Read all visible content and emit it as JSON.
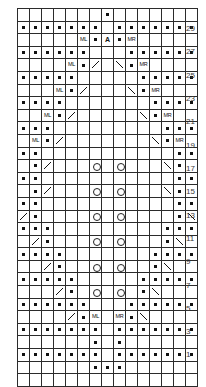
{
  "chart": {
    "columns": 15,
    "rows": 30,
    "cell_width_px": 11,
    "cell_height_px": 11.6,
    "grid_color": "#2b2b2b",
    "background": "#ffffff",
    "symbol_color": "#111111",
    "legend": {
      "dot": "purl",
      "yo": "yarn-over",
      "k2tog": "left-leaning-decrease",
      "ssk": "right-leaning-decrease",
      "cdd": "central-double-decrease",
      "ML": "make-left",
      "MR": "make-right",
      "blank": "knit"
    },
    "row_numbers": [
      {
        "label": "29",
        "top_px": 24
      },
      {
        "label": "27",
        "top_px": 47
      },
      {
        "label": "25",
        "top_px": 71
      },
      {
        "label": "23",
        "top_px": 94
      },
      {
        "label": "21",
        "top_px": 117
      },
      {
        "label": "19",
        "top_px": 141
      },
      {
        "label": "17",
        "top_px": 164
      },
      {
        "label": "15",
        "top_px": 187
      },
      {
        "label": "13",
        "top_px": 211
      },
      {
        "label": "11",
        "top_px": 234
      },
      {
        "label": "9",
        "top_px": 257
      },
      {
        "label": "7",
        "top_px": 281
      },
      {
        "label": "5",
        "top_px": 304
      },
      {
        "label": "3",
        "top_px": 327
      },
      {
        "label": "1",
        "top_px": 350
      }
    ],
    "cells": [
      [
        "",
        "",
        "",
        "",
        "",
        "",
        "",
        "dot",
        "",
        "",
        "",
        "",
        "",
        "",
        ""
      ],
      [
        "dot",
        "dot",
        "dot",
        "dot",
        "dot",
        "dot",
        "dot",
        "",
        "dot",
        "dot",
        "dot",
        "dot",
        "dot",
        "dot",
        "dot"
      ],
      [
        "",
        "",
        "",
        "",
        "",
        "ML",
        "dot",
        "cdd",
        "dot",
        "MR",
        "",
        "",
        "",
        "",
        ""
      ],
      [
        "dot",
        "dot",
        "dot",
        "dot",
        "dot",
        "dot",
        "",
        "",
        "",
        "dot",
        "dot",
        "dot",
        "dot",
        "dot",
        "dot"
      ],
      [
        "",
        "",
        "",
        "",
        "ML",
        "dot",
        "k2tog",
        "",
        "ssk",
        "dot",
        "MR",
        "",
        "",
        "",
        ""
      ],
      [
        "dot",
        "dot",
        "dot",
        "dot",
        "dot",
        "",
        "",
        "",
        "",
        "",
        "dot",
        "dot",
        "dot",
        "dot",
        "dot"
      ],
      [
        "",
        "",
        "",
        "ML",
        "dot",
        "k2tog",
        "",
        "",
        "",
        "ssk",
        "dot",
        "MR",
        "",
        "",
        ""
      ],
      [
        "dot",
        "dot",
        "dot",
        "dot",
        "",
        "",
        "",
        "",
        "",
        "",
        "",
        "dot",
        "dot",
        "dot",
        "dot"
      ],
      [
        "",
        "",
        "ML",
        "dot",
        "k2tog",
        "",
        "",
        "",
        "",
        "",
        "ssk",
        "dot",
        "MR",
        "",
        ""
      ],
      [
        "dot",
        "dot",
        "dot",
        "",
        "",
        "",
        "",
        "",
        "",
        "",
        "",
        "",
        "dot",
        "dot",
        "dot"
      ],
      [
        "",
        "ML",
        "dot",
        "k2tog",
        "",
        "",
        "",
        "",
        "",
        "",
        "",
        "ssk",
        "dot",
        "MR",
        ""
      ],
      [
        "dot",
        "dot",
        "",
        "",
        "",
        "",
        "",
        "",
        "",
        "",
        "",
        "",
        "",
        "dot",
        "dot"
      ],
      [
        "",
        "dot",
        "k2tog",
        "",
        "",
        "",
        "yo",
        "",
        "yo",
        "",
        "",
        "",
        "ssk",
        "dot",
        ""
      ],
      [
        "dot",
        "dot",
        "",
        "",
        "",
        "",
        "",
        "",
        "",
        "",
        "",
        "",
        "",
        "dot",
        "dot"
      ],
      [
        "",
        "dot",
        "k2tog",
        "",
        "",
        "",
        "yo",
        "",
        "yo",
        "",
        "",
        "",
        "ssk",
        "dot",
        ""
      ],
      [
        "dot",
        "dot",
        "",
        "",
        "",
        "",
        "",
        "",
        "",
        "",
        "",
        "",
        "",
        "dot",
        "dot"
      ],
      [
        "k2tog",
        "dot",
        "",
        "",
        "",
        "",
        "yo",
        "",
        "yo",
        "",
        "",
        "",
        "",
        "dot",
        "ssk"
      ],
      [
        "dot",
        "dot",
        "dot",
        "",
        "",
        "",
        "",
        "",
        "",
        "",
        "",
        "",
        "dot",
        "dot",
        "dot"
      ],
      [
        "",
        "k2tog",
        "dot",
        "",
        "",
        "",
        "yo",
        "",
        "yo",
        "",
        "",
        "",
        "dot",
        "ssk",
        ""
      ],
      [
        "dot",
        "dot",
        "dot",
        "dot",
        "",
        "",
        "",
        "",
        "",
        "",
        "",
        "dot",
        "dot",
        "dot",
        "dot"
      ],
      [
        "",
        "",
        "k2tog",
        "dot",
        "",
        "",
        "yo",
        "",
        "yo",
        "",
        "",
        "dot",
        "ssk",
        "",
        ""
      ],
      [
        "dot",
        "dot",
        "dot",
        "dot",
        "dot",
        "",
        "",
        "",
        "",
        "",
        "dot",
        "dot",
        "dot",
        "dot",
        "dot"
      ],
      [
        "",
        "",
        "",
        "k2tog",
        "dot",
        "",
        "yo",
        "",
        "yo",
        "",
        "dot",
        "ssk",
        "",
        "",
        ""
      ],
      [
        "dot",
        "dot",
        "dot",
        "dot",
        "dot",
        "dot",
        "",
        "",
        "",
        "dot",
        "dot",
        "dot",
        "dot",
        "dot",
        "dot"
      ],
      [
        "",
        "",
        "",
        "",
        "k2tog",
        "dot",
        "ML",
        "",
        "MR",
        "dot",
        "ssk",
        "",
        "",
        "",
        ""
      ],
      [
        "dot",
        "dot",
        "dot",
        "dot",
        "dot",
        "dot",
        "dot",
        "",
        "dot",
        "dot",
        "dot",
        "dot",
        "dot",
        "dot",
        "dot"
      ],
      [
        "",
        "",
        "",
        "",
        "",
        "",
        "dot",
        "",
        "dot",
        "",
        "",
        "",
        "",
        "",
        ""
      ],
      [
        "dot",
        "dot",
        "dot",
        "dot",
        "dot",
        "dot",
        "dot",
        "",
        "dot",
        "dot",
        "dot",
        "dot",
        "dot",
        "dot",
        "dot"
      ],
      [
        "",
        "",
        "",
        "",
        "",
        "",
        "dot",
        "dot",
        "dot",
        "",
        "",
        "",
        "",
        "",
        ""
      ],
      [
        "",
        "",
        "",
        "",
        "",
        "",
        "",
        "",
        "",
        "",
        "",
        "",
        "",
        "",
        ""
      ]
    ]
  }
}
